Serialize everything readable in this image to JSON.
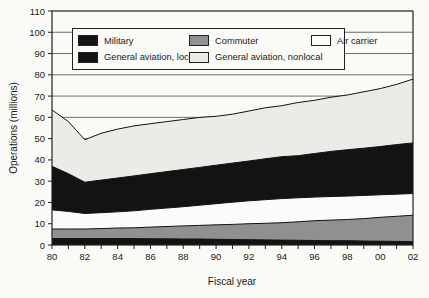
{
  "figure": {
    "y_axis_title": "Operations (millions)",
    "x_axis_title": "Fiscal year",
    "background": "#fafaf7",
    "frame_color": "#222222",
    "grid_color": "#4a4a4a",
    "text_color": "#1a1a1a"
  },
  "legend": {
    "items": [
      {
        "label": "Military",
        "color": "#131313"
      },
      {
        "label": "Commuter",
        "color": "#909090"
      },
      {
        "label": "Air carrier",
        "color": "#fbfbf9"
      },
      {
        "label": "General aviation, local",
        "color": "#131313"
      },
      {
        "label": "General aviation, nonlocal",
        "color": "#ebebe8"
      }
    ]
  },
  "chart_data": {
    "type": "area",
    "stacked": true,
    "title": "",
    "xlabel": "Fiscal year",
    "ylabel": "Operations (millions)",
    "ylim": [
      0,
      110
    ],
    "y_ticks": [
      0,
      10,
      20,
      30,
      40,
      50,
      60,
      70,
      80,
      90,
      100,
      110
    ],
    "grid": "horizontal",
    "legend_position": "top-left-inside",
    "x": [
      1980,
      1981,
      1982,
      1983,
      1984,
      1985,
      1986,
      1987,
      1988,
      1989,
      1990,
      1991,
      1992,
      1993,
      1994,
      1995,
      1996,
      1997,
      1998,
      1999,
      2000,
      2001,
      2002
    ],
    "x_tick_years": [
      1980,
      1982,
      1984,
      1986,
      1988,
      1990,
      1992,
      1994,
      1996,
      1998,
      2000,
      2002
    ],
    "x_tick_labels": [
      "80",
      "82",
      "84",
      "86",
      "88",
      "90",
      "92",
      "94",
      "96",
      "98",
      "00",
      "02"
    ],
    "series": [
      {
        "name": "Military",
        "color": "#131313",
        "values": [
          3.0,
          3.0,
          3.0,
          3.0,
          3.0,
          3.0,
          2.9,
          2.9,
          2.8,
          2.8,
          2.7,
          2.6,
          2.5,
          2.4,
          2.3,
          2.2,
          2.1,
          2.0,
          2.0,
          1.9,
          1.8,
          1.7,
          1.6
        ]
      },
      {
        "name": "Commuter",
        "color": "#909090",
        "values": [
          4.5,
          4.5,
          4.5,
          4.7,
          5.0,
          5.1,
          5.5,
          5.8,
          6.2,
          6.4,
          6.8,
          7.1,
          7.5,
          7.8,
          8.2,
          8.7,
          9.3,
          9.7,
          10.0,
          10.5,
          11.2,
          11.8,
          12.4
        ]
      },
      {
        "name": "Air carrier",
        "color": "#fbfbf9",
        "values": [
          9.0,
          8.3,
          7.3,
          7.5,
          7.6,
          8.0,
          8.4,
          8.7,
          9.0,
          9.5,
          9.9,
          10.4,
          10.8,
          11.1,
          11.3,
          11.3,
          11.1,
          11.1,
          11.0,
          10.9,
          10.6,
          10.4,
          10.2
        ]
      },
      {
        "name": "General aviation, local",
        "color": "#131313",
        "values": [
          20.5,
          17.7,
          14.7,
          15.3,
          15.9,
          16.4,
          16.7,
          17.1,
          17.5,
          17.8,
          18.1,
          18.4,
          18.7,
          19.2,
          19.7,
          19.8,
          20.5,
          21.2,
          21.8,
          22.2,
          22.7,
          23.3,
          23.8
        ]
      },
      {
        "name": "General aviation, nonlocal",
        "color": "#ebebe8",
        "values": [
          26.5,
          24.5,
          20.0,
          22.0,
          23.0,
          23.5,
          23.5,
          23.5,
          23.5,
          23.5,
          23.0,
          23.0,
          23.5,
          24.0,
          24.0,
          25.0,
          25.0,
          25.5,
          25.7,
          26.5,
          27.2,
          28.3,
          30.0
        ]
      }
    ],
    "totals_by_year_note": "stack totals rise from ~63.5 (1980), dip to ~49.5 (1982), reach ~78 (2002)"
  }
}
